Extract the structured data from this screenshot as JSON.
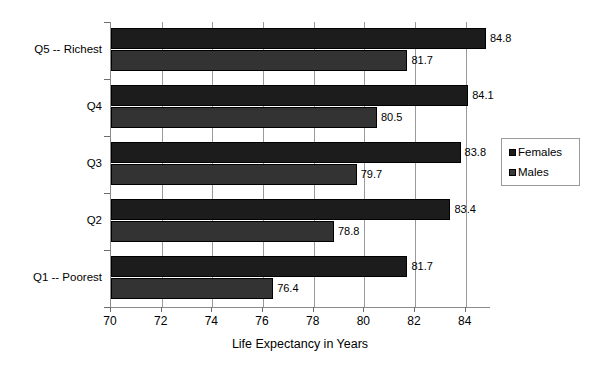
{
  "chart_data": {
    "type": "bar",
    "orientation": "horizontal",
    "title": "",
    "xlabel": "Life Expectancy in Years",
    "ylabel": "",
    "xlim": [
      70,
      85
    ],
    "xticks": [
      70,
      72,
      74,
      76,
      78,
      80,
      82,
      84
    ],
    "grid": true,
    "legend_position": "right",
    "categories": [
      "Q1 -- Poorest",
      "Q2",
      "Q3",
      "Q4",
      "Q5 -- Richest"
    ],
    "series": [
      {
        "name": "Females",
        "color": "#1c1c1c",
        "values": [
          81.7,
          83.4,
          83.8,
          84.1,
          84.8
        ]
      },
      {
        "name": "Males",
        "color": "#333333",
        "values": [
          76.4,
          78.8,
          79.7,
          80.5,
          81.7
        ]
      }
    ],
    "data_labels": {
      "Females": [
        "81.7",
        "83.4",
        "83.8",
        "84.1",
        "84.8"
      ],
      "Males": [
        "76.4",
        "78.8",
        "79.7",
        "80.5",
        "81.7"
      ]
    }
  },
  "axis": {
    "x_title": "Life Expectancy in Years",
    "tick_labels": [
      "70",
      "72",
      "74",
      "76",
      "78",
      "80",
      "82",
      "84"
    ]
  },
  "legend": {
    "items": [
      {
        "label": "Females",
        "swatch": "females-swatch"
      },
      {
        "label": "Males",
        "swatch": "males-swatch"
      }
    ]
  }
}
